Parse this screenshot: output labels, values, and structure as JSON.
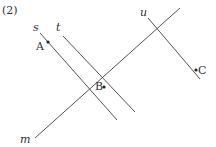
{
  "problem_label": "(2)",
  "lines": [
    {
      "name": "s",
      "x1": 40,
      "y1": 33,
      "x2": 117,
      "y2": 120
    },
    {
      "name": "t",
      "x1": 63,
      "y1": 36,
      "x2": 135,
      "y2": 112
    },
    {
      "name": "u",
      "x1": 148,
      "y1": 18,
      "x2": 200,
      "y2": 79
    },
    {
      "name": "m",
      "x1": 35,
      "y1": 138,
      "x2": 180,
      "y2": 8
    }
  ],
  "line_labels": {
    "s": "s",
    "t": "t",
    "u": "u",
    "m": "m"
  },
  "points": [
    {
      "name": "A",
      "x": 48,
      "y": 42
    },
    {
      "name": "B",
      "x": 104,
      "y": 87
    },
    {
      "name": "C",
      "x": 196,
      "y": 70
    }
  ],
  "point_labels": {
    "A": "A",
    "B": "B",
    "C": "C"
  },
  "colors": {
    "line": "#555555",
    "text": "#333333"
  }
}
